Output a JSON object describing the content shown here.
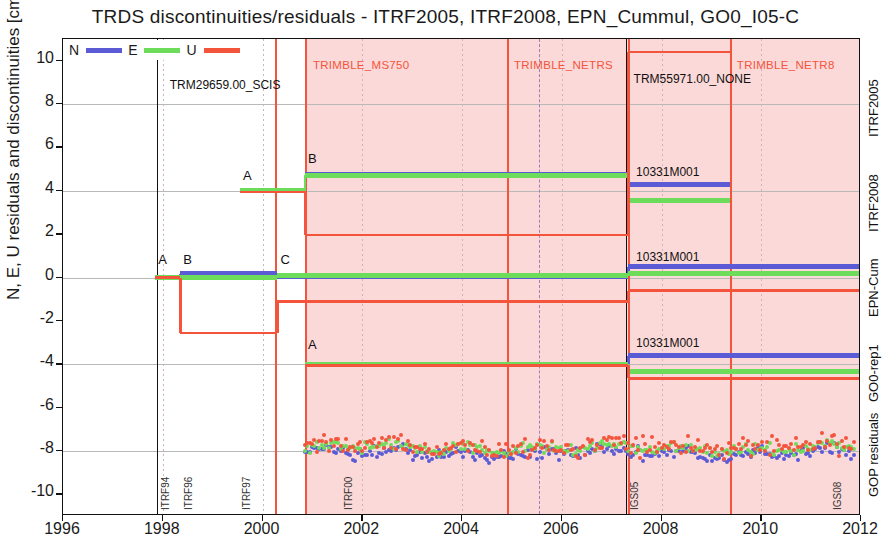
{
  "title": "TRDS discontinuities/residuals  -  ITRF2005, ITRF2008, EPN_Cummul, GO0_I05-C",
  "axes": {
    "ylabel": "N, E, U residuals and discontinuities [cm] - 4 cm shifts",
    "xlabel": "",
    "yticks": [
      "10",
      "8",
      "6",
      "4",
      "2",
      "0",
      "-2",
      "-4",
      "-6",
      "-8",
      "-10"
    ],
    "ytick_values": [
      10,
      8,
      6,
      4,
      2,
      0,
      -2,
      -4,
      -6,
      -8,
      -10
    ],
    "xticks": [
      "1996",
      "1998",
      "2000",
      "2002",
      "2004",
      "2006",
      "2008",
      "2010",
      "2012"
    ],
    "xtick_values": [
      1996,
      1998,
      2000,
      2002,
      2004,
      2006,
      2008,
      2010,
      2012
    ],
    "xlim": [
      1996,
      2012
    ],
    "ylim": [
      -11,
      11
    ]
  },
  "legend": {
    "items": [
      {
        "label": "N",
        "color": "#5b5bd6"
      },
      {
        "label": "E",
        "color": "#6ddc5a"
      },
      {
        "label": "U",
        "color": "#f4543c"
      }
    ]
  },
  "right_labels": [
    {
      "text": "ITRF2005",
      "y": 8.0
    },
    {
      "text": "ITRF2008",
      "y": 3.6
    },
    {
      "text": "EPN-Cum",
      "y": -0.3
    },
    {
      "text": "GO0-rep1",
      "y": -4.2
    },
    {
      "text": "GOP residuals",
      "y": -8.6
    }
  ],
  "receiver_labels": [
    {
      "text": "TRIMBLE_MS750",
      "x": 2000.95,
      "y": 9.6
    },
    {
      "text": "TRIMBLE_NETRS",
      "x": 2004.98,
      "y": 9.6
    },
    {
      "text": "TRIMBLE_NETR8",
      "x": 2009.45,
      "y": 9.6
    }
  ],
  "antenna_labels": [
    {
      "text": "TRM29659.00_SCIS",
      "x": 1998.1,
      "y": 8.6
    },
    {
      "text": "TRM55971.00_NONE",
      "x": 2007.4,
      "y": 8.9
    }
  ],
  "site_labels": [
    {
      "text": "10331M001",
      "x": 2007.45,
      "y": 4.55
    },
    {
      "text": "10331M001",
      "x": 2007.45,
      "y": 0.62
    },
    {
      "text": "10331M001",
      "x": 2007.45,
      "y": -3.35
    }
  ],
  "markers": [
    {
      "text": "A",
      "x": 1999.55,
      "y": 4.4
    },
    {
      "text": "B",
      "x": 2000.85,
      "y": 5.2
    },
    {
      "text": "A",
      "x": 1997.85,
      "y": 0.52
    },
    {
      "text": "B",
      "x": 1998.35,
      "y": 0.52
    },
    {
      "text": "C",
      "x": 2000.3,
      "y": 0.52
    },
    {
      "text": "A",
      "x": 2000.85,
      "y": -3.4
    }
  ],
  "frame_labels": [
    {
      "text": "ITRF94",
      "x": 1997.88
    },
    {
      "text": "ITRF96",
      "x": 1998.35
    },
    {
      "text": "ITRF97",
      "x": 1999.5
    },
    {
      "text": "ITRF00",
      "x": 2001.55
    },
    {
      "text": "IGS05",
      "x": 2007.28
    },
    {
      "text": "IGS08",
      "x": 2011.35
    }
  ],
  "shading": {
    "color": "#fbd9d8",
    "from": 2000.85,
    "to": 2012
  },
  "vertical_lines": [
    {
      "x": 2000.25,
      "color": "#f4543c",
      "style": "solid"
    },
    {
      "x": 2000.85,
      "color": "#f4543c",
      "style": "solid"
    },
    {
      "x": 2004.9,
      "color": "#f4543c",
      "style": "solid"
    },
    {
      "x": 2007.33,
      "color": "#f4543c",
      "style": "solid"
    },
    {
      "x": 2009.38,
      "color": "#f4543c",
      "style": "solid"
    },
    {
      "x": 1997.88,
      "color": "#111111",
      "style": "solid"
    },
    {
      "x": 2007.28,
      "color": "#111111",
      "style": "solid"
    },
    {
      "x": 2005.55,
      "color": "#9a7fbf",
      "style": "dashed"
    }
  ],
  "horizontal_gridlines": [
    8.0,
    4.0,
    0.0,
    -4.0,
    -8.0
  ],
  "chart_data": {
    "type": "line",
    "title": "TRDS discontinuities/residuals  -  ITRF2005, ITRF2008, EPN_Cummul, GO0_I05-C",
    "xlabel": "",
    "ylabel": "N, E, U residuals and discontinuities [cm] - 4 cm shifts",
    "xlim": [
      1996,
      2012
    ],
    "ylim": [
      -11,
      11
    ],
    "grid": true,
    "legend_position": "top-left",
    "series": [
      {
        "name": "ITRF2008 N",
        "color": "#5b5bd6",
        "row": "ITRF2008",
        "steps": [
          {
            "from": 1999.55,
            "to": 2000.85,
            "value": 4.0
          },
          {
            "from": 2000.85,
            "to": 2007.33,
            "value": 4.75
          },
          {
            "from": 2007.33,
            "to": 2009.38,
            "value": 4.3
          }
        ]
      },
      {
        "name": "ITRF2008 E",
        "color": "#6ddc5a",
        "row": "ITRF2008",
        "steps": [
          {
            "from": 1999.55,
            "to": 2000.85,
            "value": 4.0
          },
          {
            "from": 2000.85,
            "to": 2007.33,
            "value": 4.72
          },
          {
            "from": 2007.33,
            "to": 2009.38,
            "value": 3.55
          }
        ]
      },
      {
        "name": "ITRF2008 U",
        "color": "#f4543c",
        "row": "ITRF2008",
        "steps": [
          {
            "from": 1999.55,
            "to": 2000.85,
            "value": 3.95
          },
          {
            "from": 2000.85,
            "to": 2007.33,
            "value": 1.95
          },
          {
            "from": 2007.33,
            "to": 2009.38,
            "value": 10.4
          }
        ]
      },
      {
        "name": "EPN-Cum N",
        "color": "#5b5bd6",
        "row": "EPN-Cum",
        "steps": [
          {
            "from": 1997.85,
            "to": 1998.35,
            "value": 0.0
          },
          {
            "from": 1998.35,
            "to": 2000.3,
            "value": 0.18
          },
          {
            "from": 2000.3,
            "to": 2007.33,
            "value": 0.05
          },
          {
            "from": 2007.33,
            "to": 2012.0,
            "value": 0.5
          }
        ]
      },
      {
        "name": "EPN-Cum E",
        "color": "#6ddc5a",
        "row": "EPN-Cum",
        "steps": [
          {
            "from": 1997.85,
            "to": 1998.35,
            "value": 0.0
          },
          {
            "from": 1998.35,
            "to": 2000.3,
            "value": 0.02
          },
          {
            "from": 2000.3,
            "to": 2007.33,
            "value": 0.1
          },
          {
            "from": 2007.33,
            "to": 2012.0,
            "value": 0.18
          }
        ]
      },
      {
        "name": "EPN-Cum U",
        "color": "#f4543c",
        "row": "EPN-Cum",
        "steps": [
          {
            "from": 1997.85,
            "to": 1998.35,
            "value": 0.0
          },
          {
            "from": 1998.35,
            "to": 2000.3,
            "value": -2.55
          },
          {
            "from": 2000.3,
            "to": 2007.33,
            "value": -1.1
          },
          {
            "from": 2007.33,
            "to": 2012.0,
            "value": -0.6
          }
        ]
      },
      {
        "name": "GO0-rep1 N",
        "color": "#5b5bd6",
        "row": "GO0-rep1",
        "steps": [
          {
            "from": 2000.85,
            "to": 2007.33,
            "value": -4.0
          },
          {
            "from": 2007.33,
            "to": 2012.0,
            "value": -3.62
          }
        ]
      },
      {
        "name": "GO0-rep1 E",
        "color": "#6ddc5a",
        "row": "GO0-rep1",
        "steps": [
          {
            "from": 2000.85,
            "to": 2007.33,
            "value": -4.0
          },
          {
            "from": 2007.33,
            "to": 2012.0,
            "value": -4.35
          }
        ]
      },
      {
        "name": "GO0-rep1 U",
        "color": "#f4543c",
        "row": "GO0-rep1",
        "steps": [
          {
            "from": 2000.85,
            "to": 2007.33,
            "value": -4.05
          },
          {
            "from": 2007.33,
            "to": 2012.0,
            "value": -4.65
          }
        ]
      }
    ],
    "residual_scatter": {
      "row": "GOP residuals",
      "x_from": 2000.85,
      "x_to": 2011.85,
      "center": -8.0,
      "components": [
        {
          "name": "N",
          "color": "#5b5bd6",
          "spread": 0.45,
          "offset": -0.1
        },
        {
          "name": "E",
          "color": "#6ddc5a",
          "spread": 0.35,
          "offset": 0.12
        },
        {
          "name": "U",
          "color": "#f4543c",
          "spread": 0.7,
          "offset": 0.2
        }
      ],
      "n_points_per_component": 230
    }
  }
}
